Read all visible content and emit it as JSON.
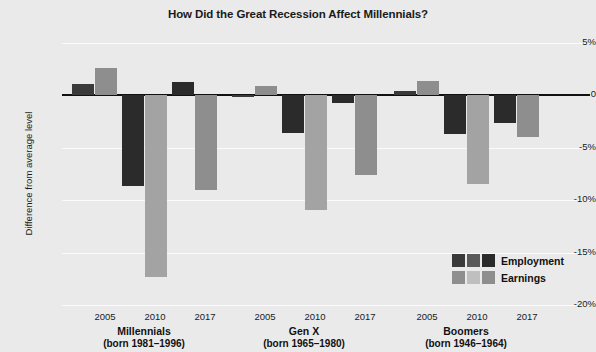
{
  "chart_data": {
    "type": "bar",
    "title": "How Did the Great Recession Affect Millennials?",
    "xlabel": "",
    "ylabel": "Difference from average level",
    "ylim": [
      -20,
      5
    ],
    "yticks": [
      5,
      0,
      -5,
      -10,
      -15,
      -20
    ],
    "ytick_labels": [
      "5%",
      "0",
      "-5%",
      "-10%",
      "-15%",
      "-20%"
    ],
    "grid": true,
    "legend_position": "bottom-right",
    "legend": [
      "Employment",
      "Earnings"
    ],
    "groups": [
      {
        "name": "Millennials",
        "born": "(born 1981–1996)",
        "years": [
          "2005",
          "2010",
          "2017"
        ]
      },
      {
        "name": "Gen X",
        "born": "(born 1965–1980)",
        "years": [
          "2005",
          "2010",
          "2017"
        ]
      },
      {
        "name": "Boomers",
        "born": "(born 1946–1964)",
        "years": [
          "2005",
          "2010",
          "2017"
        ]
      }
    ],
    "series": [
      {
        "name": "Employment",
        "values": [
          1.1,
          -8.6,
          1.3,
          -0.2,
          -3.6,
          -0.7,
          0.4,
          -3.7,
          -2.6
        ]
      },
      {
        "name": "Earnings",
        "values": [
          2.6,
          -17.3,
          -9.0,
          0.9,
          -10.9,
          -7.6,
          1.4,
          -8.5,
          -4.0
        ]
      }
    ],
    "colors": {
      "employment_2005": "#3a3a3a",
      "employment_2010": "#2b2b2b",
      "employment_2017": "#2b2b2b",
      "earnings_2005": "#8e8e8e",
      "earnings_2010": "#a3a3a3",
      "earnings_2017": "#8e8e8e",
      "background": "#eaeaea",
      "gridline": "#fbfbfb",
      "zeroline": "#111111",
      "text": "#111111"
    }
  }
}
